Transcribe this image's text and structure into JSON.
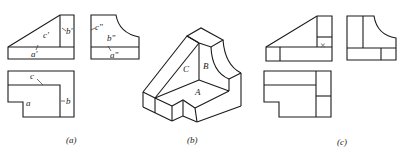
{
  "figure": {
    "panels": [
      {
        "id": "a",
        "caption": "(a)",
        "description": "Three orthographic views with face labels",
        "labels": {
          "front_c": "c'",
          "front_b": "b'",
          "front_a": "a'",
          "side_c": "c\"",
          "side_b": "b\"",
          "side_a": "a\"",
          "top_c": "c",
          "top_a": "a",
          "top_b": "b"
        }
      },
      {
        "id": "b",
        "caption": "(b)",
        "description": "Isometric view of the part",
        "labels": {
          "face_C": "C",
          "face_B": "B",
          "face_A": "A"
        }
      },
      {
        "id": "c",
        "caption": "(c)",
        "description": "Three orthographic views with error mark",
        "mark": "×"
      }
    ]
  }
}
